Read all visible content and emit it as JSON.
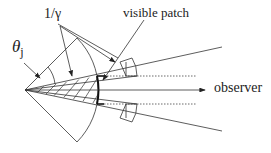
{
  "diagram": {
    "labels": {
      "theta_j": "θ",
      "theta_j_sub": "j",
      "inv_gamma": "1/γ",
      "visible_patch": "visible patch",
      "observer": "observer"
    },
    "colors": {
      "line": "#333333",
      "background": "#ffffff"
    }
  }
}
